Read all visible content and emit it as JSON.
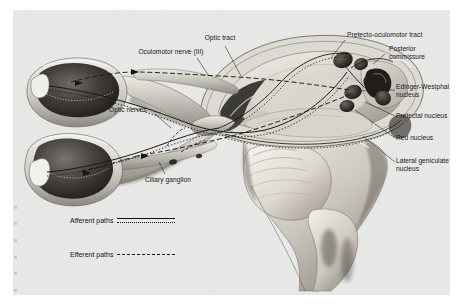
{
  "figure": {
    "background_color": "#e8e8e6",
    "labels": [
      {
        "id": "optic-tract",
        "text": "Optic tract"
      },
      {
        "id": "oculomotor-nerve",
        "text": "Oculomotor nerve (III)"
      },
      {
        "id": "pretecto-oculomotor-tract",
        "text": "Pretecto-oculomotor tract"
      },
      {
        "id": "posterior-commissure",
        "text": "Posterior\ncommissure"
      },
      {
        "id": "edinger-westphal-nucleus",
        "text": "Edinger-Westphal\nnucleus"
      },
      {
        "id": "pretectal-nucleus",
        "text": "Pretectal nucleus"
      },
      {
        "id": "red-nucleus",
        "text": "Red nucleus"
      },
      {
        "id": "lateral-geniculate-nucleus",
        "text": "Lateral geniculate\nnucleus"
      },
      {
        "id": "optic-nerves",
        "text": "Optic nerves"
      },
      {
        "id": "ciliary-ganglion",
        "text": "Ciliary ganglion"
      }
    ],
    "legend": {
      "afferent_label": "Afferent paths",
      "efferent_label": "Efferent paths"
    }
  }
}
